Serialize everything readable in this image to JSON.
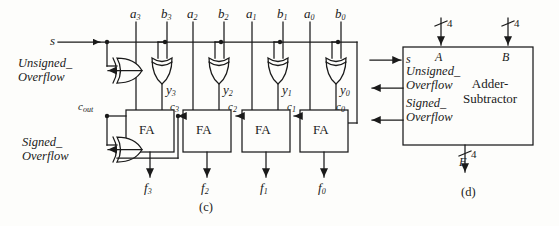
{
  "figure": {
    "panel_c_label": "(c)",
    "panel_d_label": "(d)"
  },
  "panel_c": {
    "select_input": "s",
    "operand_labels": [
      "a",
      "b",
      "a",
      "b",
      "a",
      "b",
      "a",
      "b"
    ],
    "inputs": [
      {
        "name": "a3",
        "base": "a",
        "sub": "3"
      },
      {
        "name": "b3",
        "base": "b",
        "sub": "3"
      },
      {
        "name": "a2",
        "base": "a",
        "sub": "2"
      },
      {
        "name": "b2",
        "base": "b",
        "sub": "2"
      },
      {
        "name": "a1",
        "base": "a",
        "sub": "1"
      },
      {
        "name": "b1",
        "base": "b",
        "sub": "1"
      },
      {
        "name": "a0",
        "base": "a",
        "sub": "0"
      },
      {
        "name": "b0",
        "base": "b",
        "sub": "0"
      }
    ],
    "xor_outputs": [
      {
        "base": "y",
        "sub": "3"
      },
      {
        "base": "y",
        "sub": "2"
      },
      {
        "base": "y",
        "sub": "1"
      },
      {
        "base": "y",
        "sub": "0"
      }
    ],
    "full_adders": [
      {
        "label": "FA"
      },
      {
        "label": "FA"
      },
      {
        "label": "FA"
      },
      {
        "label": "FA"
      }
    ],
    "carries": [
      {
        "base": "c",
        "sub": "out"
      },
      {
        "base": "c",
        "sub": "3"
      },
      {
        "base": "c",
        "sub": "2"
      },
      {
        "base": "c",
        "sub": "1"
      },
      {
        "base": "c",
        "sub": "0"
      }
    ],
    "sum_outputs": [
      {
        "base": "f",
        "sub": "3"
      },
      {
        "base": "f",
        "sub": "2"
      },
      {
        "base": "f",
        "sub": "1"
      },
      {
        "base": "f",
        "sub": "0"
      }
    ],
    "unsigned_overflow": {
      "line1": "Unsigned_",
      "line2": "Overflow"
    },
    "signed_overflow": {
      "line1": "Signed_",
      "line2": "Overflow"
    }
  },
  "panel_d": {
    "block_title_line1": "Adder-",
    "block_title_line2": "Subtractor",
    "port_s": "s",
    "port_A": "A",
    "port_B": "B",
    "port_F": "F",
    "bus_width_A": "4",
    "bus_width_B": "4",
    "bus_width_F": "4",
    "unsigned_overflow": {
      "line1": "Unsigned_",
      "line2": "Overflow"
    },
    "signed_overflow": {
      "line1": "Signed_",
      "line2": "Overflow"
    }
  },
  "colors": {
    "ink": "#1a1a1a",
    "paper": "#fdfdfb"
  }
}
